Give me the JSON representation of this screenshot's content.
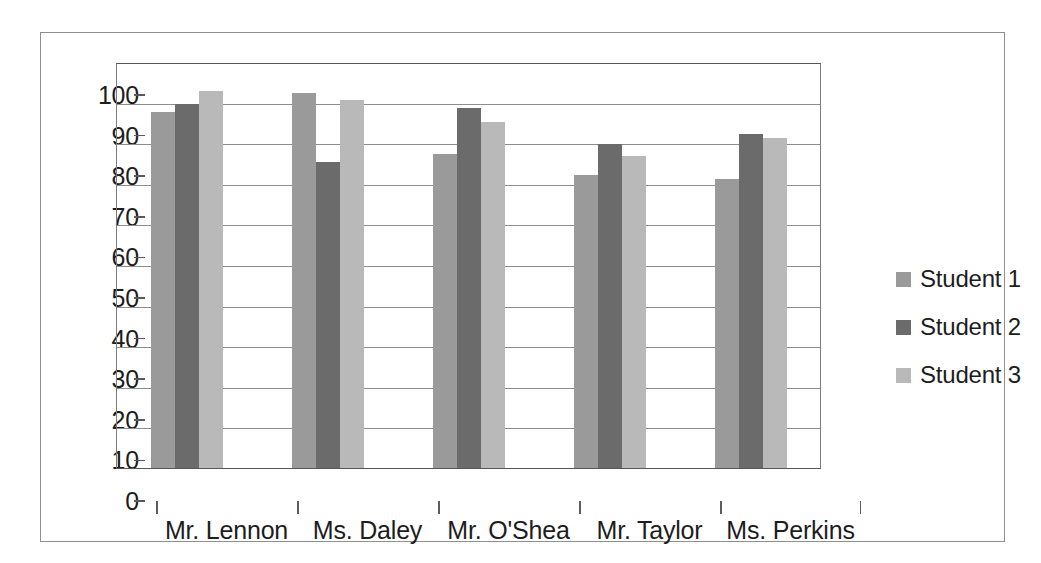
{
  "chart_data": {
    "type": "bar",
    "title": "",
    "subtitle": "",
    "xlabel": "",
    "ylabel": "",
    "categories": [
      "Mr. Lennon",
      "Ms. Daley",
      "Mr. O'Shea",
      "Mr. Taylor",
      "Ms. Perkins"
    ],
    "series": [
      {
        "name": "Student 1",
        "color": "#9a9a9a",
        "values": [
          88,
          92.5,
          77.5,
          72.5,
          71.5
        ]
      },
      {
        "name": "Student 2",
        "color": "#6b6b6b",
        "values": [
          90,
          75.5,
          89,
          80,
          82.5
        ]
      },
      {
        "name": "Student 3",
        "color": "#b9b9b9",
        "values": [
          93,
          91,
          85.5,
          77,
          81.5
        ]
      }
    ],
    "ylim": [
      0,
      100
    ],
    "ytick_step": 10,
    "yticks": [
      0,
      10,
      20,
      30,
      40,
      50,
      60,
      70,
      80,
      90,
      100
    ],
    "ytick_labels": [
      "0",
      "10",
      "20",
      "30",
      "40",
      "50",
      "60",
      "70",
      "80",
      "90",
      "100"
    ],
    "grid": "horizontal",
    "legend_position": "right",
    "annotations": []
  },
  "legend": {
    "entries": [
      {
        "label": "Student 1",
        "color": "#9a9a9a"
      },
      {
        "label": "Student 2",
        "color": "#6b6b6b"
      },
      {
        "label": "Student 3",
        "color": "#b9b9b9"
      }
    ]
  },
  "frame": {
    "border_color": "#8f8f8f",
    "plot_border_color": "#5a5a5a",
    "gridline_color": "#8d8d8d",
    "background": "#ffffff",
    "text_color": "#1d1d1d"
  }
}
